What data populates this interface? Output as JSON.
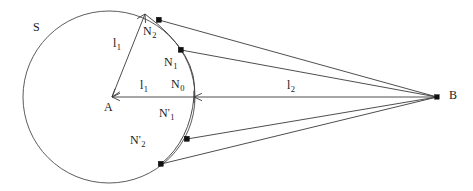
{
  "figure": {
    "type": "geometry-diagram",
    "background_color": "#ffffff",
    "stroke_color": "#3a3a3a",
    "marker_color": "#111111"
  },
  "labels": {
    "circle_name": "S",
    "center_point": "A",
    "external_point": "B",
    "radius_slanted": "l",
    "radius_slanted_sub": "1",
    "radius_horizontal": "l",
    "radius_horizontal_sub": "1",
    "distance_outer": "l",
    "distance_outer_sub": "2",
    "n0": "N",
    "n0_sub": "0",
    "n1": "N",
    "n1_sub": "1",
    "n2": "N",
    "n2_sub": "2",
    "n1_prime": "N",
    "n1_prime_mark": "'",
    "n1_prime_sub": "1",
    "n2_prime": "N",
    "n2_prime_mark": "'",
    "n2_prime_sub": "2"
  },
  "geometry": {
    "circle": {
      "cx": 109,
      "cy": 97,
      "r": 86
    },
    "point_a": {
      "x": 112,
      "y": 97
    },
    "point_b": {
      "x": 437,
      "y": 97
    },
    "point_n0": {
      "x": 194,
      "y": 97
    },
    "point_n1": {
      "x": 181,
      "y": 50
    },
    "point_n2": {
      "x": 159,
      "y": 20
    },
    "point_n1_prime": {
      "x": 187,
      "y": 139
    },
    "point_n2_prime": {
      "x": 161,
      "y": 164
    },
    "radius_arrow_tip": {
      "x": 145,
      "y": 14
    }
  },
  "label_positions": {
    "S": {
      "x": 33,
      "y": 27
    },
    "A": {
      "x": 105,
      "y": 101
    },
    "B": {
      "x": 449,
      "y": 90
    },
    "l1_slant": {
      "x": 114,
      "y": 43
    },
    "l1_horiz": {
      "x": 141,
      "y": 84
    },
    "l2": {
      "x": 288,
      "y": 84
    },
    "N0": {
      "x": 173,
      "y": 83
    },
    "N1": {
      "x": 166,
      "y": 62
    },
    "N2": {
      "x": 145,
      "y": 31
    },
    "N1p": {
      "x": 161,
      "y": 113
    },
    "N2p": {
      "x": 132,
      "y": 140
    }
  }
}
